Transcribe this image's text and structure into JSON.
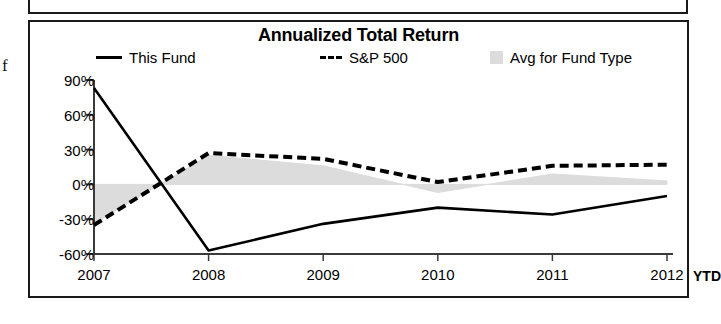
{
  "left_margin_text": "f",
  "chart": {
    "title": "Annualized Total Return",
    "legend": [
      {
        "label": "This Fund",
        "marker": "solid-line-swatch"
      },
      {
        "label": "S&P 500",
        "marker": "dashed-line-swatch"
      },
      {
        "label": "Avg for Fund Type",
        "marker": "gray-square-swatch"
      }
    ],
    "x_axis_suffix": "YTD"
  },
  "chart_data": {
    "type": "line",
    "title": "Annualized Total Return",
    "xlabel": "",
    "ylabel": "",
    "categories": [
      "2007",
      "2008",
      "2009",
      "2010",
      "2011",
      "2012"
    ],
    "x_tick_labels": [
      "2007",
      "2008",
      "2009",
      "2010",
      "2011",
      "2012"
    ],
    "y_tick_labels": [
      "90%",
      "60%",
      "30%",
      "0%",
      "-30%",
      "-60%"
    ],
    "y_ticks": [
      90,
      60,
      30,
      0,
      -30,
      -60
    ],
    "ylim": [
      -60,
      90
    ],
    "grid": false,
    "legend_position": "top",
    "series": [
      {
        "name": "This Fund",
        "style": "solid",
        "color": "#000000",
        "values": [
          83,
          -57,
          -34,
          -20,
          -26,
          -10
        ]
      },
      {
        "name": "S&P 500",
        "style": "dashed",
        "color": "#000000",
        "values": [
          -35,
          27,
          22,
          2,
          16,
          17
        ]
      },
      {
        "name": "Avg for Fund Type",
        "style": "fill",
        "color": "#dcdcdc",
        "values": [
          -34,
          25,
          16,
          -7,
          9,
          3
        ]
      }
    ],
    "fill_between": {
      "series": "Avg for Fund Type",
      "baseline": 0,
      "color": "#dcdcdc"
    }
  }
}
